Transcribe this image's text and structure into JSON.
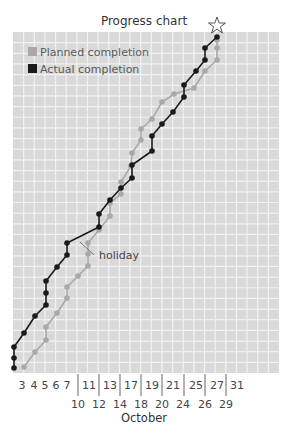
{
  "chart_data": {
    "type": "line",
    "title": "Progress chart",
    "xlabel": "October",
    "ylabel": "",
    "grid": true,
    "legend_position": "top-left",
    "legend": [
      {
        "name": "Planned completion",
        "color": "#a9a9a9"
      },
      {
        "name": "Actual completion",
        "color": "#1a1a1a"
      }
    ],
    "x_ticks_upper": [
      "3",
      "4",
      "5",
      "6",
      "7",
      "11",
      "13",
      "17",
      "19",
      "21",
      "25",
      "27",
      "31"
    ],
    "x_ticks_lower": [
      "10",
      "12",
      "14",
      "18",
      "20",
      "24",
      "26",
      "29"
    ],
    "annotations": [
      {
        "text": "holiday",
        "target": "Planned completion"
      },
      {
        "text": "star",
        "target": "goal / finish"
      }
    ],
    "series": [
      {
        "name": "Actual completion",
        "color": "#1a1a1a",
        "points_px": [
          [
            14,
            368
          ],
          [
            14,
            358
          ],
          [
            14,
            347
          ],
          [
            24,
            333
          ],
          [
            35,
            316
          ],
          [
            46,
            305
          ],
          [
            46,
            293
          ],
          [
            46,
            281
          ],
          [
            57,
            267
          ],
          [
            67,
            255
          ],
          [
            67,
            243
          ],
          [
            99,
            227
          ],
          [
            99,
            214
          ],
          [
            110,
            200
          ],
          [
            121,
            188
          ],
          [
            132,
            178
          ],
          [
            132,
            165
          ],
          [
            152,
            151
          ],
          [
            152,
            136
          ],
          [
            162,
            124
          ],
          [
            173,
            112
          ],
          [
            184,
            97
          ],
          [
            184,
            85
          ],
          [
            196,
            71
          ],
          [
            205,
            60
          ],
          [
            205,
            48
          ],
          [
            217,
            37
          ]
        ]
      },
      {
        "name": "Planned completion",
        "color": "#a9a9a9",
        "points_px": [
          [
            24,
            367
          ],
          [
            35,
            352
          ],
          [
            46,
            340
          ],
          [
            46,
            327
          ],
          [
            57,
            313
          ],
          [
            67,
            298
          ],
          [
            67,
            287
          ],
          [
            78,
            276
          ],
          [
            88,
            266
          ],
          [
            88,
            254
          ],
          [
            88,
            243
          ],
          [
            99,
            230
          ],
          [
            110,
            216
          ],
          [
            110,
            203
          ],
          [
            121,
            194
          ],
          [
            121,
            182
          ],
          [
            131,
            166
          ],
          [
            132,
            153
          ],
          [
            141,
            140
          ],
          [
            141,
            129
          ],
          [
            152,
            119
          ],
          [
            162,
            102
          ],
          [
            174,
            94
          ],
          [
            194,
            88
          ],
          [
            205,
            71
          ],
          [
            217,
            60
          ],
          [
            217,
            48
          ],
          [
            217,
            40
          ]
        ]
      }
    ],
    "plot_area_px": {
      "x0": 13,
      "y0": 32,
      "x1": 279,
      "y1": 373
    }
  },
  "colors": {
    "grid_bg": "#d9d9d9",
    "grid_line": "#f2f2f2",
    "actual": "#1a1a1a",
    "planned": "#a9a9a9"
  }
}
